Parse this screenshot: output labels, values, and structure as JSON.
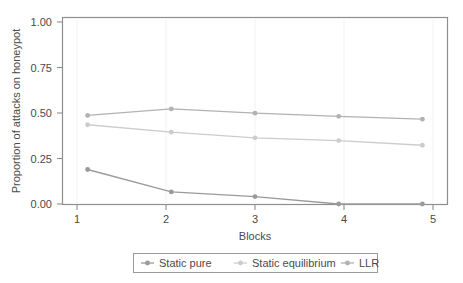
{
  "chart_data": {
    "type": "line",
    "title": "",
    "xlabel": "Blocks",
    "ylabel": "Proportion of attacks on honeypot",
    "categories": [
      "1",
      "2",
      "3",
      "4",
      "5"
    ],
    "x": [
      1,
      2,
      3,
      4,
      5
    ],
    "xlim": [
      0.7,
      5.3
    ],
    "ylim": [
      0.0,
      1.0
    ],
    "yticks": [
      0.0,
      0.25,
      0.5,
      0.75,
      1.0
    ],
    "ytick_labels": [
      "0.00",
      "0.25",
      "0.50",
      "0.75",
      "1.00"
    ],
    "xticks": [
      1,
      2,
      3,
      4,
      5
    ],
    "xtick_labels": [
      "1",
      "2",
      "3",
      "4",
      "5"
    ],
    "grid": false,
    "legend_position": "below",
    "series": [
      {
        "name": "Static pure",
        "color": "#9a9a9a",
        "marker": "circle",
        "values": [
          0.185,
          0.065,
          0.04,
          0.0,
          0.0
        ]
      },
      {
        "name": "Static equilibrium",
        "color": "#cccccc",
        "marker": "circle",
        "values": [
          0.425,
          0.385,
          0.355,
          0.34,
          0.315
        ]
      },
      {
        "name": "LLR",
        "color": "#b2b2b2",
        "marker": "circle",
        "values": [
          0.475,
          0.51,
          0.487,
          0.47,
          0.455
        ]
      }
    ]
  },
  "axes": {
    "y_title": "Proportion of attacks on honeypot",
    "x_title": "Blocks",
    "y_labels": [
      "1.00",
      "0.75",
      "0.50",
      "0.25",
      "0.00"
    ],
    "x_labels": [
      "1",
      "2",
      "3",
      "4",
      "5"
    ]
  },
  "legend": {
    "entries": [
      {
        "label": "Static pure",
        "color": "#9a9a9a"
      },
      {
        "label": "Static equilibrium",
        "color": "#cccccc"
      },
      {
        "label": "LLR",
        "color": "#b2b2b2"
      }
    ]
  }
}
